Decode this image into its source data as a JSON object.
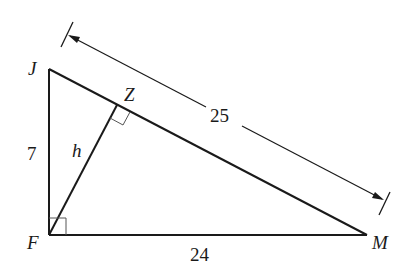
{
  "diagram": {
    "type": "right-triangle-altitude",
    "vertices": {
      "J": {
        "label": "J",
        "x": 49,
        "y": 69
      },
      "F": {
        "label": "F",
        "x": 49,
        "y": 235
      },
      "M": {
        "label": "M",
        "x": 367,
        "y": 235
      },
      "Z": {
        "label": "Z",
        "x": 117,
        "y": 105
      }
    },
    "segments": {
      "JF": {
        "label": "7"
      },
      "FM": {
        "label": "24"
      },
      "JM": {
        "label": "25"
      },
      "FZ": {
        "label": "h"
      }
    },
    "right_angles": [
      "F",
      "Z"
    ],
    "dimension_line": {
      "of": "JM",
      "label": "25"
    },
    "colors": {
      "stroke": "#1a1a1a",
      "background": "#ffffff"
    }
  }
}
